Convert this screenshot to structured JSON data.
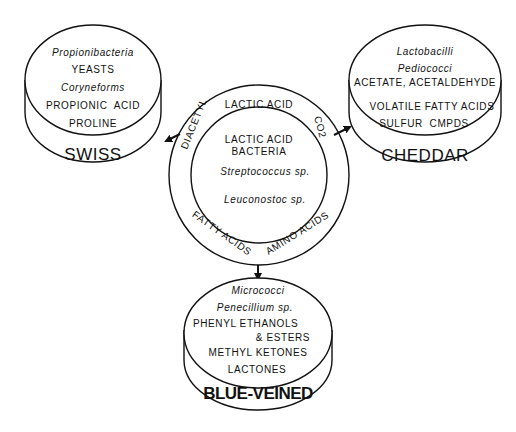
{
  "diagram": {
    "center": {
      "outer_ring_labels": {
        "top": "LACTIC ACID",
        "left": "DIACETYL",
        "right": "CO2",
        "bottom_left": "FATTY ACIDS",
        "bottom_right": "AMINO ACIDS"
      },
      "inner": {
        "title_line1": "LACTIC ACID",
        "title_line2": "BACTERIA",
        "organism1": "Streptococcus sp.",
        "organism2": "Leuconostoc sp."
      }
    },
    "cheeses": [
      {
        "name": "SWISS",
        "items": [
          {
            "text": "Propionibacteria",
            "italic": true
          },
          {
            "text": "YEASTS",
            "italic": false
          },
          {
            "text": "Coryneforms",
            "italic": true
          },
          {
            "text": "PROPIONIC  ACID",
            "italic": false
          },
          {
            "text": "PROLINE",
            "italic": false
          }
        ]
      },
      {
        "name": "CHEDDAR",
        "items": [
          {
            "text": "Lactobacilli",
            "italic": true
          },
          {
            "text": "Pediococci",
            "italic": true
          },
          {
            "text": "ACETATE, ACETALDEHYDE",
            "italic": false
          },
          {
            "text": "VOLATILE FATTY ACIDS",
            "italic": false
          },
          {
            "text": "SULFUR  CMPDS",
            "italic": false
          }
        ]
      },
      {
        "name": "BLUE-VEINED",
        "items": [
          {
            "text": "Micrococci",
            "italic": true
          },
          {
            "text": "Penecillium sp.",
            "italic": true
          },
          {
            "text": "PHENYL ETHANOLS",
            "italic": false
          },
          {
            "text": "& ESTERS",
            "italic": false
          },
          {
            "text": "METHYL KETONES",
            "italic": false
          },
          {
            "text": "LACTONES",
            "italic": false
          }
        ]
      }
    ],
    "arrows": [
      "center-to-swiss",
      "center-to-cheddar",
      "center-to-blue-veined"
    ],
    "colors": {
      "ink": "#111111",
      "background": "#ffffff"
    }
  }
}
